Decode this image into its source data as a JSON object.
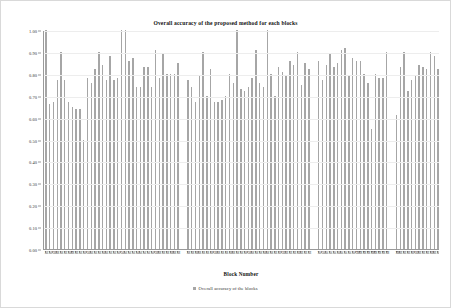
{
  "chart_data": {
    "type": "bar",
    "title": "Overall accuracy of the proposed method for each blocks",
    "xlabel": "Block Number",
    "ylabel": "Accuracy (%)",
    "ylim": [
      0.0,
      1.0
    ],
    "ytick_labels": [
      "1.00",
      "0.90",
      "0.80",
      "0.70",
      "0.60",
      "0.50",
      "0.40",
      "0.30",
      "0.20",
      "0.10",
      "0.00"
    ],
    "ytick_values": [
      1.0,
      0.9,
      0.8,
      0.7,
      0.6,
      0.5,
      0.4,
      0.3,
      0.2,
      0.1,
      0.0
    ],
    "grid": true,
    "legend_position": "bottom",
    "series": [
      {
        "name": "Overall accuracy of the blocks",
        "color": "#a6a6a6",
        "values": [
          1.0,
          0.66,
          0.67,
          0.77,
          0.9,
          0.77,
          0.67,
          0.65,
          0.64,
          0.64,
          0.5,
          0.78,
          0.76,
          0.82,
          0.9,
          0.84,
          0.77,
          0.88,
          0.77,
          0.78,
          1.0,
          1.0,
          0.86,
          0.87,
          0.74,
          0.74,
          0.83,
          0.83,
          0.74,
          0.91,
          0.78,
          0.89,
          0.8,
          0.8,
          0.8,
          0.85,
          0.77,
          0.74,
          0.67,
          0.79,
          0.9,
          0.7,
          0.82,
          0.67,
          0.67,
          0.68,
          0.7,
          0.8,
          0.76,
          1.0,
          0.73,
          0.72,
          0.74,
          0.78,
          0.91,
          0.76,
          0.74,
          1.0,
          0.8,
          0.7,
          0.83,
          0.81,
          0.79,
          0.86,
          0.84,
          0.9,
          0.75,
          0.85,
          0.82,
          0.86,
          0.77,
          0.84,
          0.89,
          0.83,
          0.85,
          0.91,
          0.92,
          0.79,
          0.87,
          0.86,
          0.86,
          0.8,
          0.76,
          0.55,
          0.8,
          0.78,
          0.78,
          0.9,
          0.61,
          0.83,
          0.9,
          0.72,
          0.77,
          0.79,
          0.84,
          0.83,
          0.82,
          0.9,
          0.88,
          0.82
        ],
        "categories": [
          "B1",
          "B2",
          "B3",
          "B4",
          "B5",
          "B6",
          "B7",
          "B8",
          "B9",
          "B10",
          "B11",
          "B12",
          "B13",
          "B14",
          "B15",
          "B16",
          "B17",
          "B18",
          "B19",
          "B20",
          "B21",
          "B22",
          "B23",
          "B24",
          "B25",
          "B26",
          "B27",
          "B28",
          "B29",
          "B30",
          "B31",
          "B32",
          "B33",
          "B34",
          "B35",
          "B36",
          "B37",
          "B38",
          "B39",
          "B40",
          "B41",
          "B42",
          "B43",
          "B44",
          "B45",
          "B46",
          "B47",
          "B48",
          "B49",
          "B50",
          "B51",
          "B52",
          "B53",
          "B54",
          "B55",
          "B56",
          "B57",
          "B58",
          "B59",
          "B60",
          "B61",
          "B62",
          "B63",
          "B64",
          "B65",
          "B66",
          "B67",
          "B68",
          "B69",
          "B70",
          "B71",
          "B72",
          "B73",
          "B74",
          "B75",
          "B76",
          "B77",
          "B78",
          "B79",
          "B80",
          "B81",
          "B82",
          "B83",
          "B84",
          "B85",
          "B86",
          "B87",
          "B88",
          "B89",
          "B90",
          "B91",
          "B92",
          "B93",
          "B94",
          "B95",
          "B96",
          "B97",
          "B98",
          "B99",
          "B100"
        ],
        "group_gaps_after": [
          36,
          69,
          88
        ]
      }
    ]
  },
  "legend": {
    "items": [
      {
        "label": "Overall accuracy of the blocks",
        "color": "#a6a6a6"
      }
    ]
  }
}
